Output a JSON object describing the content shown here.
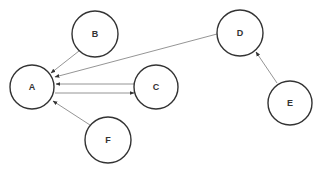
{
  "diagram": {
    "type": "directed-graph",
    "nodes": [
      {
        "id": "A",
        "label": "A",
        "cx": 32,
        "cy": 87,
        "r": 22
      },
      {
        "id": "B",
        "label": "B",
        "cx": 95,
        "cy": 34,
        "r": 23
      },
      {
        "id": "C",
        "label": "C",
        "cx": 156,
        "cy": 87,
        "r": 22
      },
      {
        "id": "D",
        "label": "D",
        "cx": 240,
        "cy": 33,
        "r": 23
      },
      {
        "id": "E",
        "label": "E",
        "cx": 290,
        "cy": 103,
        "r": 22
      },
      {
        "id": "F",
        "label": "F",
        "cx": 108,
        "cy": 140,
        "r": 23
      }
    ],
    "edges": [
      {
        "from": "B",
        "to": "A",
        "x1": 79,
        "y1": 51,
        "x2": 51,
        "y2": 73
      },
      {
        "from": "D",
        "to": "A",
        "x1": 217,
        "y1": 34,
        "x2": 55,
        "y2": 77
      },
      {
        "from": "C",
        "to": "A",
        "x1": 134,
        "y1": 84,
        "x2": 56,
        "y2": 84
      },
      {
        "from": "A",
        "to": "C",
        "x1": 55,
        "y1": 93,
        "x2": 134,
        "y2": 93
      },
      {
        "from": "F",
        "to": "A",
        "x1": 90,
        "y1": 125,
        "x2": 53,
        "y2": 101
      },
      {
        "from": "E",
        "to": "D",
        "x1": 277,
        "y1": 83,
        "x2": 256,
        "y2": 52
      }
    ]
  }
}
